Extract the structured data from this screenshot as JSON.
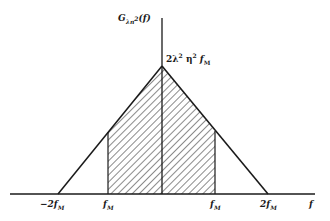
{
  "diagram": {
    "type": "triangular power spectral density",
    "y_axis_label": {
      "base": "G",
      "subscript": "λn",
      "subscript_sup": "2",
      "argument": "(f)"
    },
    "x_axis_label": "f",
    "peak_label": {
      "coef": "2λ",
      "sup1": "2",
      "eta": " η",
      "sup2": "2",
      "f": " f",
      "sub": "M"
    },
    "tick_labels": [
      {
        "id": "neg-2fm",
        "prefix": "−2",
        "f": "f",
        "sub": "M"
      },
      {
        "id": "neg-fm",
        "prefix": "",
        "f": "f",
        "sub": "M"
      },
      {
        "id": "pos-fm",
        "prefix": "",
        "f": "f",
        "sub": "M"
      },
      {
        "id": "pos-2fm",
        "prefix": "2",
        "f": "f",
        "sub": "M"
      }
    ],
    "shaded_region": "hatched band between −f_M and f_M",
    "colors": {
      "line": "#1a1a1a",
      "hatch": "#2a2a2a",
      "background": "#ffffff"
    }
  }
}
